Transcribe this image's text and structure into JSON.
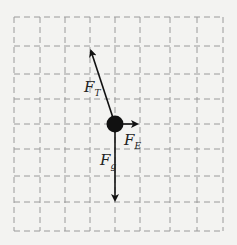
{
  "diagram": {
    "type": "free-body-diagram",
    "grid": {
      "cols": 8,
      "rows": 8,
      "style": "dashed",
      "color": "#9a9a9a"
    },
    "object": {
      "shape": "filled-circle",
      "color": "#111111"
    },
    "forces": [
      {
        "id": "tension",
        "label": "F",
        "subscript": "T",
        "direction": "up-left",
        "length_units": 3.5
      },
      {
        "id": "electric",
        "label": "F",
        "subscript": "E",
        "direction": "right",
        "length_units": 0.8
      },
      {
        "id": "gravity",
        "label": "F",
        "subscript": "g",
        "direction": "down",
        "length_units": 3
      }
    ]
  }
}
